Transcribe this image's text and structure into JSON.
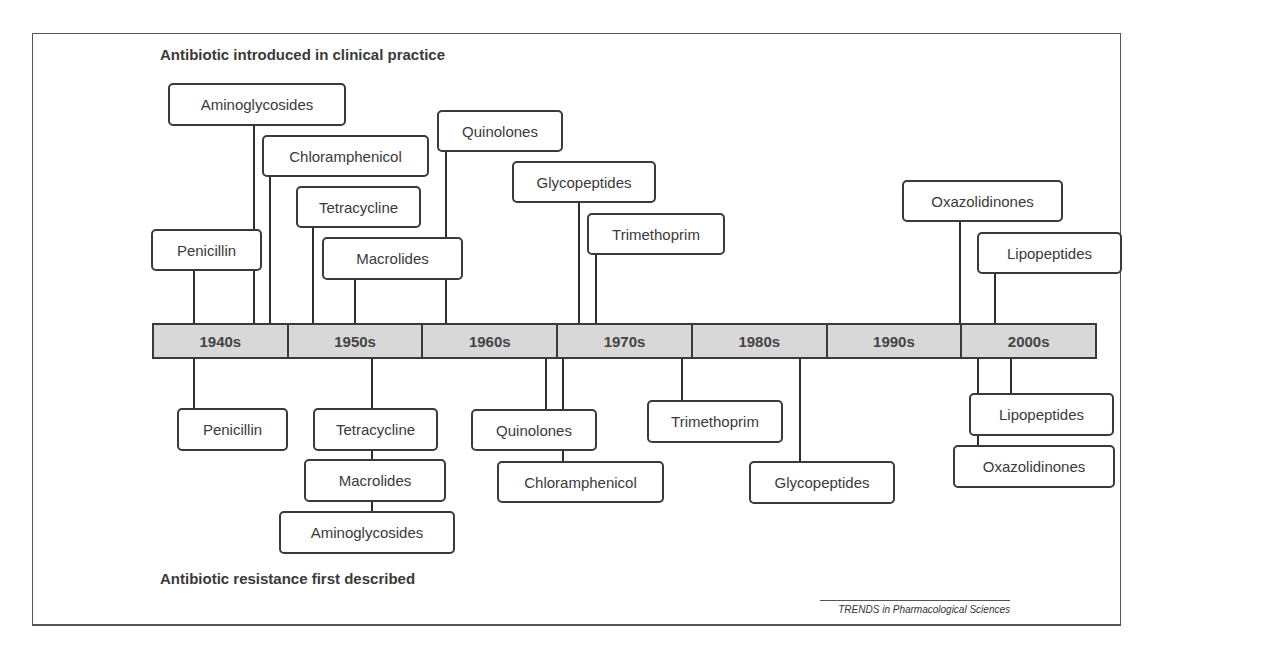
{
  "diagram": {
    "top_heading": "Antibiotic introduced in clinical practice",
    "bottom_heading": "Antibiotic resistance first described",
    "source_caption": "TRENDS in Pharmacological Sciences",
    "timeline": {
      "decades": [
        "1940s",
        "1950s",
        "1960s",
        "1970s",
        "1980s",
        "1990s",
        "2000s"
      ]
    },
    "introduced": [
      {
        "label": "Aminoglycosides",
        "box": [
          168,
          83,
          178,
          43
        ],
        "line_x": 254,
        "line_from": 126
      },
      {
        "label": "Chloramphenicol",
        "box": [
          262,
          135,
          167,
          42
        ],
        "line_x": 270,
        "line_from": 177
      },
      {
        "label": "Tetracycline",
        "box": [
          296,
          186,
          125,
          42
        ],
        "line_x": 313,
        "line_from": 228
      },
      {
        "label": "Penicillin",
        "box": [
          151,
          229,
          111,
          42
        ],
        "line_x": 194,
        "line_from": 271
      },
      {
        "label": "Macrolides",
        "box": [
          322,
          237,
          141,
          43
        ],
        "line_x": 355,
        "line_from": 280
      },
      {
        "label": "Quinolones",
        "box": [
          437,
          110,
          126,
          42
        ],
        "line_x": 446,
        "line_from": 152
      },
      {
        "label": "Glycopeptides",
        "box": [
          512,
          161,
          144,
          42
        ],
        "line_x": 579,
        "line_from": 203
      },
      {
        "label": "Trimethoprim",
        "box": [
          587,
          213,
          138,
          42
        ],
        "line_x": 596,
        "line_from": 255
      },
      {
        "label": "Oxazolidinones",
        "box": [
          902,
          180,
          161,
          42
        ],
        "line_x": 960,
        "line_from": 222
      },
      {
        "label": "Lipopeptides",
        "box": [
          977,
          232,
          145,
          42
        ],
        "line_x": 995,
        "line_from": 274
      }
    ],
    "resistance": [
      {
        "label": "Penicillin",
        "box": [
          177,
          408,
          111,
          43
        ],
        "line_x": 194,
        "line_to": 408
      },
      {
        "label": "Tetracycline",
        "box": [
          313,
          408,
          125,
          43
        ],
        "line_x": 372,
        "line_to": 408
      },
      {
        "label": "Macrolides",
        "box": [
          304,
          459,
          142,
          43
        ],
        "line_x": 372,
        "line_to": 459
      },
      {
        "label": "Aminoglycosides",
        "box": [
          279,
          511,
          176,
          43
        ],
        "line_x": 372,
        "line_to": 511
      },
      {
        "label": "Quinolones",
        "box": [
          471,
          409,
          126,
          42
        ],
        "line_x": 546,
        "line_to": 409
      },
      {
        "label": "Chloramphenicol",
        "box": [
          497,
          461,
          167,
          42
        ],
        "line_x": 563,
        "line_to": 461
      },
      {
        "label": "Trimethoprim",
        "box": [
          647,
          400,
          136,
          43
        ],
        "line_x": 682,
        "line_to": 400
      },
      {
        "label": "Glycopeptides",
        "box": [
          749,
          461,
          146,
          43
        ],
        "line_x": 800,
        "line_to": 461
      },
      {
        "label": "Lipopeptides",
        "box": [
          969,
          393,
          145,
          43
        ],
        "line_x": 1011,
        "line_to": 393
      },
      {
        "label": "Oxazolidinones",
        "box": [
          953,
          445,
          162,
          43
        ],
        "line_x": 978,
        "line_to": 445
      }
    ]
  }
}
